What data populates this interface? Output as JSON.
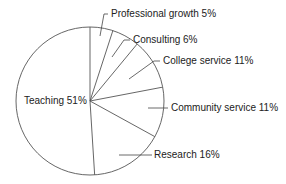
{
  "chart_data": {
    "type": "pie",
    "title": "",
    "categories": [
      "Teaching",
      "Research",
      "Community service",
      "College service",
      "Consulting",
      "Professional growth"
    ],
    "values": [
      51,
      16,
      11,
      11,
      6,
      5
    ],
    "labels": [
      "Teaching 51%",
      "Research  16%",
      "Community service  11%",
      "College service  11%",
      "Consulting  6%",
      "Professional growth  5%"
    ],
    "colors": {
      "fill": "#ffffff",
      "stroke": "#555555"
    }
  }
}
